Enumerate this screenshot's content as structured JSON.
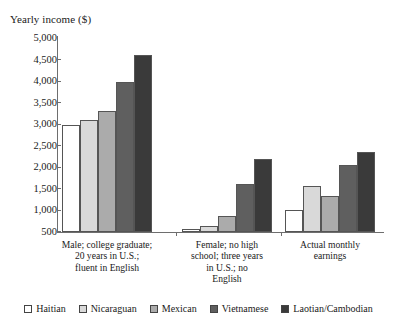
{
  "chart_data": {
    "type": "bar",
    "title": "Yearly income ($)",
    "xlabel": "",
    "ylabel": "Yearly income ($)",
    "ylim": [
      500,
      5000
    ],
    "ytick_step": 500,
    "grid": false,
    "legend_position": "bottom",
    "yticks": [
      "5,000",
      "4,500",
      "4,000",
      "3,500",
      "3,000",
      "2,500",
      "2,000",
      "1,500",
      "1,000",
      "500"
    ],
    "ytick_values": [
      5000,
      4500,
      4000,
      3500,
      3000,
      2500,
      2000,
      1500,
      1000,
      500
    ],
    "categories": [
      "Male; college graduate;\n20 years in U.S.;\nfluent in English",
      "Female; no high\nschool; three years\nin U.S.; no\nEnglish",
      "Actual monthly\nearnings"
    ],
    "series": [
      {
        "name": "Haitian",
        "color": "#ffffff",
        "values": [
          2980,
          560,
          1000
        ]
      },
      {
        "name": "Nicaraguan",
        "color": "#d9d9d9",
        "values": [
          3100,
          640,
          1570
        ]
      },
      {
        "name": "Mexican",
        "color": "#ababab",
        "values": [
          3310,
          880,
          1330
        ]
      },
      {
        "name": "Vietnamese",
        "color": "#5f5f5f",
        "values": [
          3990,
          1620,
          2050
        ]
      },
      {
        "name": "Laotian/Cambodian",
        "color": "#3a3a3a",
        "values": [
          4600,
          2200,
          2350
        ]
      }
    ]
  }
}
